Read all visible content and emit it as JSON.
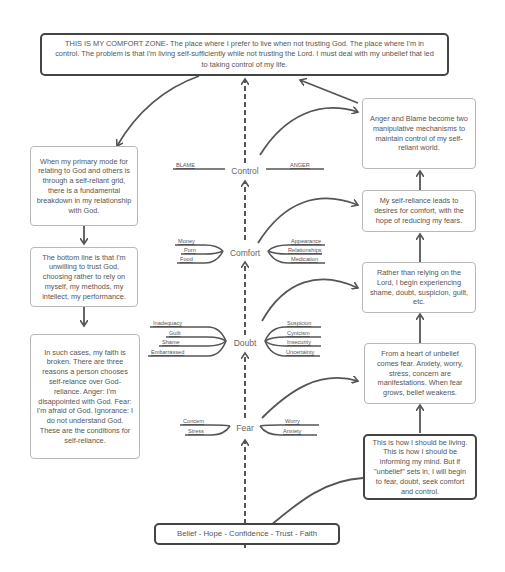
{
  "diagram": {
    "top_box": "THIS IS MY COMFORT ZONE- The place where I prefer to live when not trusting God. The place where I'm in control. The problem is that I'm living self-sufficiently while not trusting the Lord. I must deal with my unbelief that led to taking control of my life.",
    "bottom_box": "Belief - Hope - Confidence - Trust - Faith",
    "left_boxes": [
      "When my primary mode for relating to God and others is through a self-reliant grid, there is a fundamental breakdown in my relationship with God.",
      "The bottom line is that I'm unwilling to trust God, choosing rather to rely on myself, my methods, my intellect, my performance.",
      "In such cases, my faith is broken. There are three reasons a person chooses self-relance over God-reliance. Anger: I'm disappointed with God. Fear: I'm afraid of God. Ignorance: I do not understand God. These are the conditions for self-reliance."
    ],
    "right_boxes": [
      "Anger and Blame become two manipulative mechanisms to maintain control of my self-reliant world.",
      "My self-reliance leads to desires for comfort, with the hope of reducing my fears.",
      "Rather than relying on the Lord, I begin experiencing shame, doubt, suspicion, guilt, etc.",
      "From a heart of unbelief comes fear. Anxiety, worry, stress, concern are manifestations. When fear grows, belief weakens.",
      "This is how I should be living. This is how I should be informing my mind. But if \"unbelief\" sets in, I will begin to fear, doubt, seek comfort and control."
    ],
    "nodes": {
      "control": {
        "label": "Control",
        "left": [
          "BLAME"
        ],
        "right": [
          "ANGER"
        ]
      },
      "comfort": {
        "label": "Comfort",
        "left": [
          "Money",
          "Porn",
          "Food"
        ],
        "right": [
          "Appearance",
          "Relationships",
          "Medication"
        ]
      },
      "doubt": {
        "label": "Doubt",
        "left": [
          "Inadequacy",
          "Guilt",
          "Shame",
          "Embarrassed"
        ],
        "right": [
          "Suspicion",
          "Cynicism",
          "Insecurity",
          "Uncertainty"
        ]
      },
      "fear": {
        "label": "Fear",
        "left": [
          "Concern",
          "Stress"
        ],
        "right": [
          "Worry",
          "Anxiety"
        ]
      }
    }
  }
}
